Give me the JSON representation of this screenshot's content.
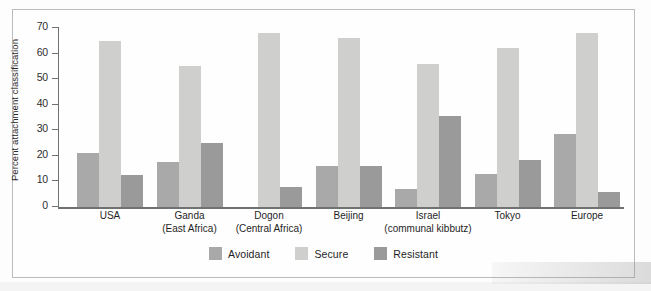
{
  "chart_data": {
    "type": "bar",
    "title": "",
    "xlabel": "",
    "ylabel": "Percent attachment classification",
    "ylim": [
      0,
      70
    ],
    "yticks": [
      0,
      10,
      20,
      30,
      40,
      50,
      60,
      70
    ],
    "grid": false,
    "legend_position": "bottom-center",
    "categories": [
      "USA",
      "Ganda (East Africa)",
      "Dogon (Central Africa)",
      "Beijing",
      "Israel (communal kibbutz)",
      "Tokyo",
      "Europe"
    ],
    "series": [
      {
        "name": "Avoidant",
        "color": "#a9a9a9",
        "values": [
          21,
          17.5,
          0,
          16,
          7,
          13,
          28.5
        ]
      },
      {
        "name": "Secure",
        "color": "#cfcfcd",
        "values": [
          65,
          55,
          68,
          66,
          56,
          62,
          68
        ]
      },
      {
        "name": "Resistant",
        "color": "#9a9a9a",
        "values": [
          12.5,
          25,
          8,
          16,
          35.5,
          18.5,
          6
        ]
      }
    ]
  },
  "axis": {
    "y_title": "Percent attachment classification",
    "y_ticks": [
      "70",
      "60",
      "50",
      "40",
      "30",
      "20",
      "10",
      "0"
    ]
  },
  "groups": [
    {
      "name": "USA",
      "line1": "USA",
      "line2": ""
    },
    {
      "name": "Ganda",
      "line1": "Ganda",
      "line2": "(East Africa)"
    },
    {
      "name": "Dogon",
      "line1": "Dogon",
      "line2": "(Central Africa)"
    },
    {
      "name": "Beijing",
      "line1": "Beijing",
      "line2": ""
    },
    {
      "name": "Israel",
      "line1": "Israel",
      "line2": "(communal kibbutz)"
    },
    {
      "name": "Tokyo",
      "line1": "Tokyo",
      "line2": ""
    },
    {
      "name": "Europe",
      "line1": "Europe",
      "line2": ""
    }
  ],
  "legend": [
    {
      "label": "Avoidant",
      "color": "#a9a9a9"
    },
    {
      "label": "Secure",
      "color": "#cfcfcd"
    },
    {
      "label": "Resistant",
      "color": "#9a9a9a"
    }
  ],
  "colors": {
    "avoidant": "#a9a9a9",
    "secure": "#cfcfcd",
    "resistant": "#9a9a9a",
    "axis": "#6f7272",
    "frame": "#b9bcbc"
  }
}
